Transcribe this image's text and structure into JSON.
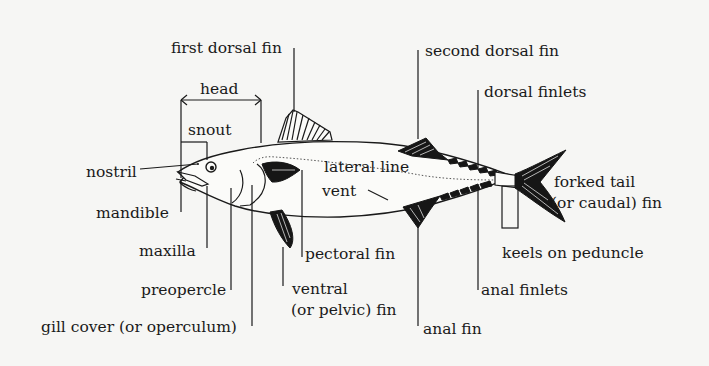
{
  "diagram": {
    "labels": {
      "first_dorsal_fin": "first dorsal fin",
      "head": "head",
      "snout": "snout",
      "nostril": "nostril",
      "mandible": "mandible",
      "maxilla": "maxilla",
      "preopercle": "preopercle",
      "gill_cover": "gill cover (or operculum)",
      "lateral_line": "lateral line",
      "vent": "vent",
      "pectoral_fin": "pectoral fin",
      "ventral_fin_1": "ventral",
      "ventral_fin_2": "(or pelvic) fin",
      "second_dorsal_fin": "second dorsal fin",
      "dorsal_finlets": "dorsal finlets",
      "forked_tail_1": "forked tail",
      "forked_tail_2": "(or caudal) fin",
      "keels": "keels on peduncle",
      "anal_finlets": "anal finlets",
      "anal_fin": "anal fin"
    }
  }
}
